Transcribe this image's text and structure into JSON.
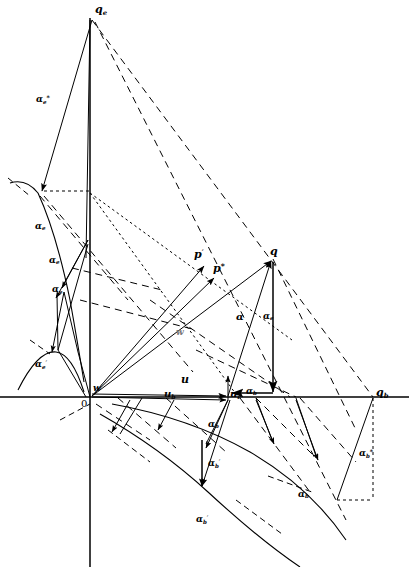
{
  "figure": {
    "type": "technical-line-diagram",
    "background": "#ffffff",
    "stroke": "#000000",
    "width": 409,
    "height": 567
  },
  "axes": {
    "vertical_axis_label": "q",
    "vertical_axis_sub": "e",
    "horizontal_axis_right_label": "q",
    "horizontal_axis_right_sub": "b",
    "origin_label": "0",
    "origin_x": 90,
    "origin_y": 397,
    "vertical_axis_x": 90,
    "vertical_axis_top_y": 18,
    "vertical_axis_bottom_y": 567,
    "horizontal_axis_y": 397,
    "horizontal_axis_left_x": 0,
    "horizontal_axis_right_x": 409
  },
  "points": {
    "q": {
      "label": "q",
      "x": 273,
      "y": 259
    },
    "q_e": {
      "label": "q",
      "sub": "e",
      "x": 90,
      "y": 22
    },
    "q_b": {
      "label": "q",
      "sub": "b",
      "x": 373,
      "y": 397
    },
    "w": {
      "label": "w",
      "x": 176,
      "y": 334
    },
    "w_prime": {
      "label": "w",
      "prime": "′",
      "x": 95,
      "y": 392
    },
    "p_prime": {
      "label": "p",
      "prime": "′",
      "x": 196,
      "y": 262
    },
    "p_star": {
      "label": "p",
      "star": "*",
      "x": 214,
      "y": 271
    },
    "u_tip": {
      "label": "u",
      "x": 228,
      "y": 397
    }
  },
  "labels": [
    {
      "name": "q-e-axis-label",
      "text": "q",
      "sub": "e",
      "x": 95,
      "y": 6,
      "size": "s11"
    },
    {
      "name": "alpha-e-star",
      "text": "α",
      "sub": "e",
      "star": "*",
      "x": 36,
      "y": 97,
      "size": "s9"
    },
    {
      "name": "alpha-e-upper",
      "text": "α",
      "sub": "e",
      "x": 35,
      "y": 225,
      "size": "s9"
    },
    {
      "name": "alpha-e-mid",
      "text": "α",
      "sub": "e",
      "x": 49,
      "y": 259,
      "size": "s9"
    },
    {
      "name": "alpha-e-prime-mid",
      "text": "α",
      "sub": "e",
      "prime": "′",
      "x": 52,
      "y": 288,
      "size": "s9"
    },
    {
      "name": "alpha-e-prime-low",
      "text": "α",
      "sub": "e",
      "prime": "′",
      "x": 35,
      "y": 363,
      "size": "s9"
    },
    {
      "name": "p-prime",
      "text": "p",
      "prime": "′",
      "x": 194,
      "y": 252,
      "size": "s11"
    },
    {
      "name": "p-star",
      "text": "p",
      "star": "*",
      "x": 213,
      "y": 265,
      "size": "s11"
    },
    {
      "name": "q-point",
      "text": "q",
      "x": 270,
      "y": 250,
      "size": "s11"
    },
    {
      "name": "alpha-center",
      "text": "α",
      "x": 236,
      "y": 315,
      "size": "s10"
    },
    {
      "name": "alpha-e-right",
      "text": "α",
      "sub": "e",
      "x": 263,
      "y": 315,
      "size": "s9"
    },
    {
      "name": "w-middle",
      "text": "w",
      "x": 176,
      "y": 330,
      "size": "s9"
    },
    {
      "name": "w-prime-origin",
      "text": "w",
      "prime": "′",
      "x": 93,
      "y": 386,
      "size": "s9"
    },
    {
      "name": "u-label",
      "text": "u",
      "x": 181,
      "y": 377,
      "size": "s11"
    },
    {
      "name": "u-b-label",
      "text": "u",
      "sub": "b",
      "x": 164,
      "y": 392,
      "size": "s10"
    },
    {
      "name": "u-e-label",
      "text": "u",
      "sub": "e",
      "x": 230,
      "y": 392,
      "size": "s10"
    },
    {
      "name": "alpha-b-axis",
      "text": "α",
      "sub": "b",
      "x": 246,
      "y": 389,
      "size": "s9"
    },
    {
      "name": "origin-zero",
      "text": "0",
      "x": 82,
      "y": 400,
      "size": "s10",
      "plain": true
    },
    {
      "name": "q-b-axis-label",
      "text": "q",
      "sub": "b",
      "x": 376,
      "y": 390,
      "size": "s11"
    },
    {
      "name": "alpha-b-upper",
      "text": "α",
      "sub": "b",
      "x": 208,
      "y": 423,
      "size": "s9"
    },
    {
      "name": "alpha-b-prime-mid",
      "text": "α",
      "sub": "b",
      "prime": "′",
      "x": 208,
      "y": 462,
      "size": "s9"
    },
    {
      "name": "alpha-b-prime-low",
      "text": "α",
      "sub": "b",
      "prime": "′",
      "x": 196,
      "y": 518,
      "size": "s9"
    },
    {
      "name": "alpha-b-right",
      "text": "α",
      "sub": "b",
      "x": 298,
      "y": 493,
      "size": "s9"
    },
    {
      "name": "alpha-b-star",
      "text": "α",
      "sub": "b",
      "star": "*",
      "x": 359,
      "y": 452,
      "size": "s9"
    }
  ],
  "line_styles": {
    "solid": "solid thin black line",
    "dashed": "long-dash construction line",
    "dotted": "fine-dotted construction line",
    "arrow": "solid line terminated with filled arrowhead"
  },
  "curves": {
    "upper_left_curve": "concave arc through (18,190) bending down to (70,385)",
    "lower_left_curve": "small arc near (20,380) through (55,352) to (85,420)",
    "lower_right_curve": "long arc from (112,405) sweeping right-down to (340,567)",
    "second_lower_curve": "parallel arc offset below the lower right curve"
  },
  "counts": {
    "labels": 24,
    "vectors": 22,
    "curves": 4
  }
}
